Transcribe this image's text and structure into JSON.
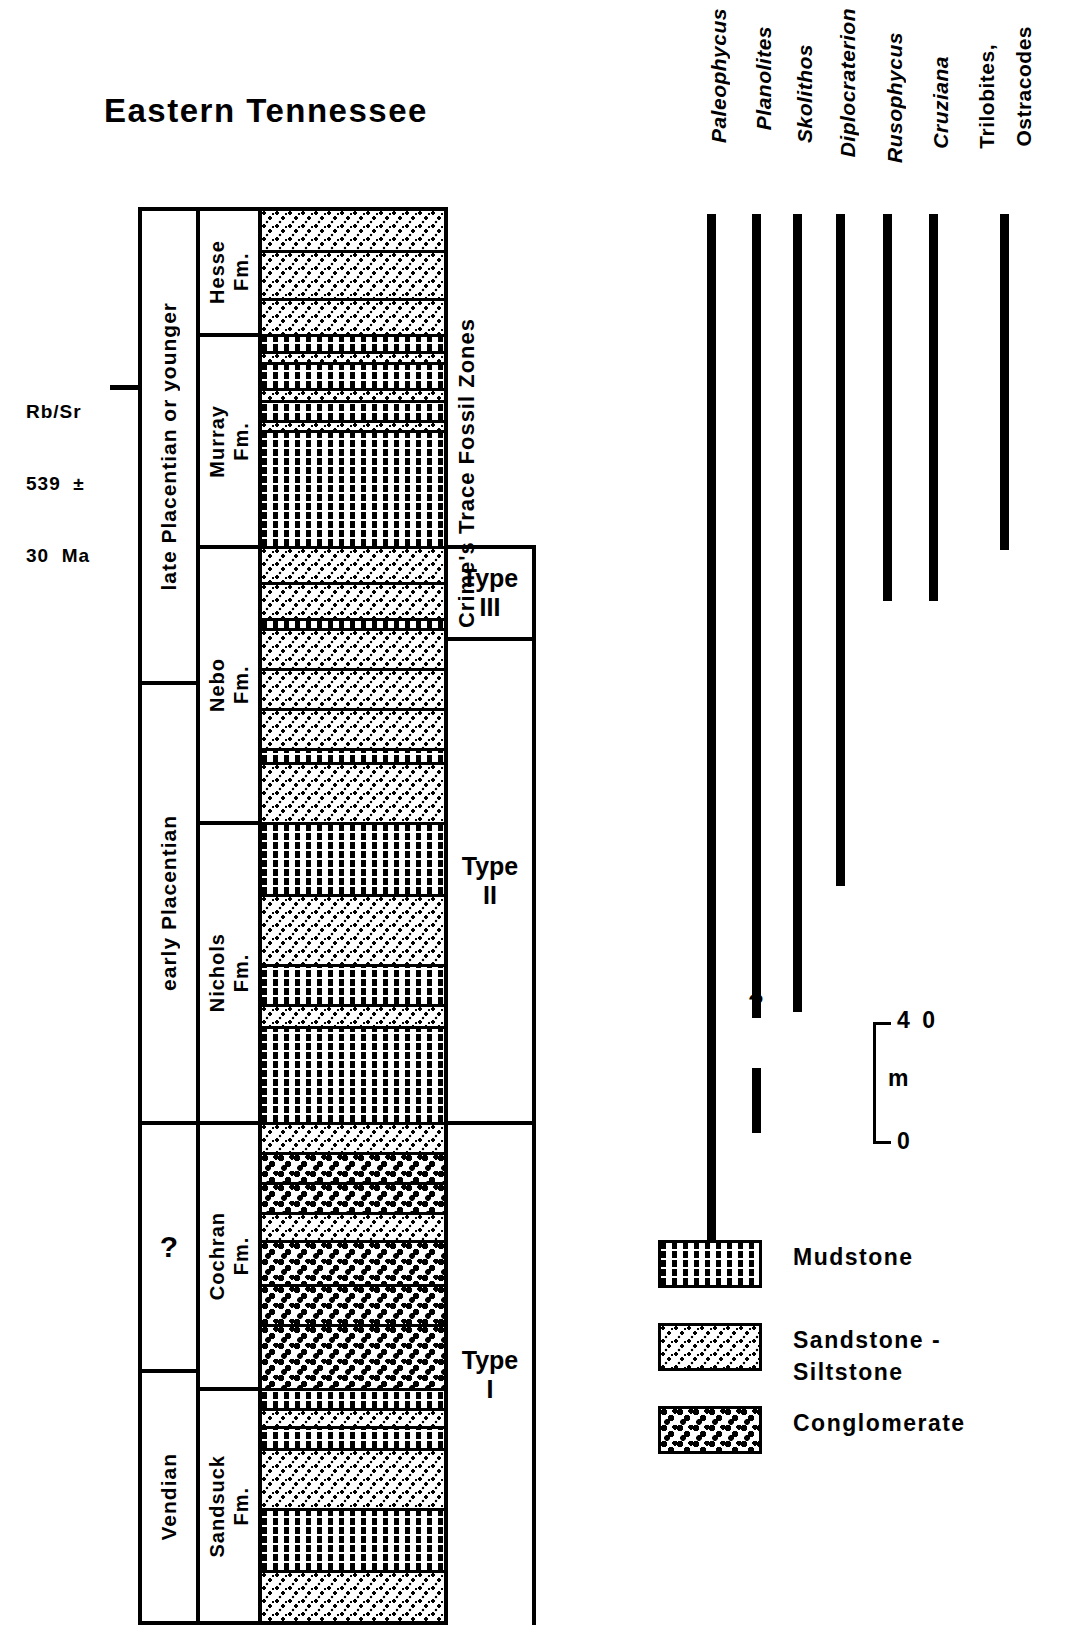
{
  "title": "Eastern Tennessee",
  "radiometric": {
    "line1": "Rb/Sr",
    "line2": "539  ±",
    "line3": "30  Ma"
  },
  "columns": {
    "age_header": "Age",
    "formation_header": "Formation",
    "lithology_header": "Lithology",
    "zones_header": "Crime's Trace\nFossil Zones"
  },
  "ages": [
    {
      "label": "late  Placentian  or  younger",
      "top": 0,
      "height": 474
    },
    {
      "label": "early  Placentian",
      "top": 474,
      "height": 440
    },
    {
      "label": "?",
      "top": 914,
      "height": 248
    },
    {
      "label": "Vendian",
      "top": 1162,
      "height": 248
    }
  ],
  "formations": [
    {
      "name": "Hesse\nFm.",
      "top": 0,
      "height": 126
    },
    {
      "name": "Murray\nFm.",
      "top": 126,
      "height": 212
    },
    {
      "name": "Nebo\nFm.",
      "top": 338,
      "height": 276
    },
    {
      "name": "Nichols\nFm.",
      "top": 614,
      "height": 300
    },
    {
      "name": "Cochran\nFm.",
      "top": 914,
      "height": 266
    },
    {
      "name": "Sandsuck\nFm.",
      "top": 1180,
      "height": 230
    }
  ],
  "lithology_beds": [
    {
      "type": "sandstone",
      "top": 0,
      "height": 42
    },
    {
      "type": "sandstone",
      "top": 42,
      "height": 48
    },
    {
      "type": "sandstone",
      "top": 90,
      "height": 36
    },
    {
      "type": "mudstone",
      "top": 126,
      "height": 17
    },
    {
      "type": "sandstone",
      "top": 143,
      "height": 11
    },
    {
      "type": "mudstone",
      "top": 154,
      "height": 26
    },
    {
      "type": "sandstone",
      "top": 180,
      "height": 12
    },
    {
      "type": "mudstone",
      "top": 192,
      "height": 20
    },
    {
      "type": "sandstone",
      "top": 212,
      "height": 10
    },
    {
      "type": "mudstone",
      "top": 222,
      "height": 116
    },
    {
      "type": "sandstone",
      "top": 338,
      "height": 36
    },
    {
      "type": "sandstone",
      "top": 374,
      "height": 36
    },
    {
      "type": "mudstone",
      "top": 410,
      "height": 10
    },
    {
      "type": "sandstone",
      "top": 420,
      "height": 40
    },
    {
      "type": "sandstone",
      "top": 460,
      "height": 40
    },
    {
      "type": "sandstone",
      "top": 500,
      "height": 40
    },
    {
      "type": "mudstone",
      "top": 540,
      "height": 14
    },
    {
      "type": "sandstone",
      "top": 554,
      "height": 60
    },
    {
      "type": "mudstone",
      "top": 614,
      "height": 72
    },
    {
      "type": "sandstone",
      "top": 686,
      "height": 70
    },
    {
      "type": "mudstone",
      "top": 756,
      "height": 40
    },
    {
      "type": "sandstone",
      "top": 796,
      "height": 22
    },
    {
      "type": "mudstone",
      "top": 818,
      "height": 96
    },
    {
      "type": "sandstone",
      "top": 914,
      "height": 30
    },
    {
      "type": "conglomerate",
      "top": 944,
      "height": 30
    },
    {
      "type": "conglomerate",
      "top": 974,
      "height": 30
    },
    {
      "type": "sandstone",
      "top": 1004,
      "height": 28
    },
    {
      "type": "conglomerate",
      "top": 1032,
      "height": 44
    },
    {
      "type": "conglomerate",
      "top": 1076,
      "height": 40
    },
    {
      "type": "conglomerate",
      "top": 1116,
      "height": 64
    },
    {
      "type": "mudstone",
      "top": 1180,
      "height": 20
    },
    {
      "type": "sandstone",
      "top": 1200,
      "height": 18
    },
    {
      "type": "mudstone",
      "top": 1218,
      "height": 22
    },
    {
      "type": "sandstone",
      "top": 1240,
      "height": 60
    },
    {
      "type": "mudstone",
      "top": 1300,
      "height": 62
    },
    {
      "type": "sandstone",
      "top": 1362,
      "height": 48
    }
  ],
  "trace_fossil_zones": [
    {
      "label": "Type\nIII",
      "top": 545,
      "height": 96
    },
    {
      "label": "Type\nII",
      "top": 641,
      "height": 484
    },
    {
      "label": "Type\nI",
      "top": 1125,
      "height": 500
    }
  ],
  "range_chart": {
    "taxa": [
      {
        "name": "Paleophycus",
        "italic": true,
        "x": 707,
        "label_top": 8,
        "segments": [
          {
            "top": 214,
            "bottom": 1248
          }
        ]
      },
      {
        "name": "Planolites",
        "italic": true,
        "x": 752,
        "label_top": 26,
        "segments": [
          {
            "top": 214,
            "bottom": 1018
          },
          {
            "top": 1068,
            "bottom": 1133
          }
        ],
        "query_mark": {
          "text": "?",
          "top": 988
        }
      },
      {
        "name": "Skolithos",
        "italic": true,
        "x": 793,
        "label_top": 44,
        "segments": [
          {
            "top": 214,
            "bottom": 1012
          }
        ]
      },
      {
        "name": "Diplocraterion",
        "italic": true,
        "x": 836,
        "label_top": 8,
        "segments": [
          {
            "top": 214,
            "bottom": 886
          }
        ]
      },
      {
        "name": "Rusophycus",
        "italic": true,
        "x": 883,
        "label_top": 32,
        "segments": [
          {
            "top": 214,
            "bottom": 601
          }
        ]
      },
      {
        "name": "Cruziana",
        "italic": true,
        "x": 929,
        "label_top": 56,
        "segments": [
          {
            "top": 214,
            "bottom": 601
          }
        ]
      },
      {
        "name": "Trilobites,",
        "italic": false,
        "x": 975,
        "label_top": 44,
        "segments": []
      },
      {
        "name": "Ostracodes",
        "italic": false,
        "x": 1012,
        "label_top": 26,
        "segments": [
          {
            "top": 214,
            "bottom": 550
          }
        ],
        "bar_x": 1000
      }
    ]
  },
  "scale": {
    "top_value": "4 0",
    "bottom_value": "0",
    "unit": "m"
  },
  "legend": [
    {
      "pattern": "mudstone",
      "label": "Mudstone",
      "top": 1240
    },
    {
      "pattern": "sandstone",
      "label": "Sandstone  -\nSiltstone",
      "top": 1323
    },
    {
      "pattern": "conglomerate",
      "label": "Conglomerate",
      "top": 1406
    }
  ],
  "chart_data": {
    "type": "table",
    "title": "Eastern Tennessee",
    "xlabel": "",
    "ylabel": "Stratigraphic thickness (m)",
    "ylim": [
      0,
      40
    ]
  }
}
